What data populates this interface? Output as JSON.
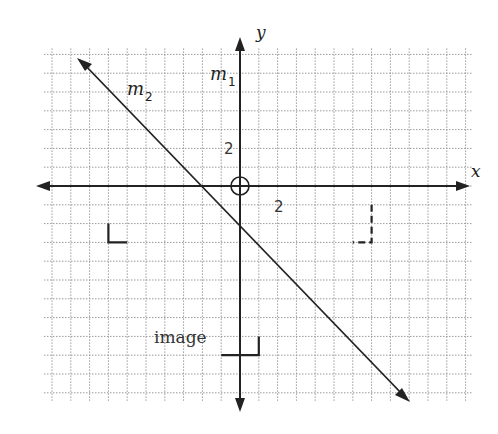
{
  "diagram": {
    "type": "coordinate-plane-reflection",
    "axes": {
      "x_label": "x",
      "y_label": "y",
      "tick_label_x": "2",
      "tick_label_y": "2",
      "grid_step_units": 1,
      "x_range": [
        -10,
        12
      ],
      "y_range": [
        -11,
        7
      ]
    },
    "lines": [
      {
        "name": "m1",
        "label": "m",
        "subscript": "1",
        "description": "y-axis"
      },
      {
        "name": "m2",
        "label": "m",
        "subscript": "2",
        "description": "line with slope -1 through (0,-2)"
      }
    ],
    "figures": [
      {
        "name": "original-L",
        "style": "solid",
        "points": [
          [
            -7,
            -2
          ],
          [
            -7,
            -3
          ],
          [
            -6,
            -3
          ]
        ]
      },
      {
        "name": "reflection-L",
        "style": "dashed",
        "points": [
          [
            7,
            -1
          ],
          [
            7,
            -3
          ],
          [
            6,
            -3
          ]
        ]
      },
      {
        "name": "image-L",
        "label": "image",
        "style": "solid",
        "points": [
          [
            1,
            -8
          ],
          [
            1,
            -9
          ],
          [
            -1,
            -9
          ]
        ]
      }
    ],
    "origin_marker": "circle",
    "image_label": "image"
  }
}
